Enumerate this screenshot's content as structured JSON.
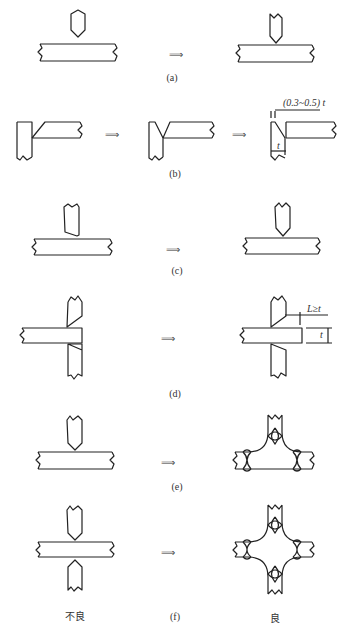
{
  "figure": {
    "panels": [
      {
        "id": "a",
        "label": "(a)"
      },
      {
        "id": "b",
        "label": "(b)",
        "annotations": {
          "gap": "(0.3~0.5) t",
          "thickness": "t"
        }
      },
      {
        "id": "c",
        "label": "(c)"
      },
      {
        "id": "d",
        "label": "(d)",
        "annotations": {
          "length": "L≥t",
          "thickness": "t"
        }
      },
      {
        "id": "e",
        "label": "(e)"
      },
      {
        "id": "f",
        "label": "(f)"
      }
    ],
    "arrow": "⟹",
    "column_labels": {
      "bad": "不良",
      "good": "良"
    }
  }
}
